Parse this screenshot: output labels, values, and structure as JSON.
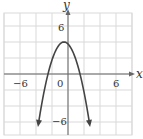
{
  "chart_data": {
    "type": "line",
    "title": "",
    "xlabel": "x",
    "ylabel": "y",
    "xlim": [
      -8,
      8
    ],
    "ylim": [
      -7.5,
      7.5
    ],
    "grid": true,
    "grid_step": 2,
    "x_tick_labels": [
      {
        "value": -6,
        "label": "−6"
      },
      {
        "value": 0,
        "label": "0"
      },
      {
        "value": 6,
        "label": "6"
      }
    ],
    "y_tick_labels": [
      {
        "value": 6,
        "label": "6"
      },
      {
        "value": -6,
        "label": "−6"
      }
    ],
    "series": [
      {
        "name": "parabola",
        "description": "downward-opening parabola, vertex near (-0.5, 4), x-intercepts near -2.5 and 1.5, arrows at both ends",
        "x": [
          -3.8,
          -3.5,
          -3,
          -2.5,
          -2,
          -1.5,
          -1,
          -0.5,
          0,
          0.5,
          1,
          1.5,
          2,
          2.5,
          2.8
        ],
        "y": [
          -8.9,
          -5.0,
          -2.25,
          0,
          1.75,
          3.0,
          3.75,
          4.0,
          3.75,
          3.0,
          1.75,
          0,
          -2.25,
          -5.0,
          -7.0
        ]
      }
    ],
    "legend": null
  },
  "labels": {
    "x_axis": "x",
    "y_axis": "y",
    "tick_x_neg6": "−6",
    "tick_x_0": "0",
    "tick_x_6": "6",
    "tick_y_6": "6",
    "tick_y_neg6": "−6"
  },
  "colors": {
    "grid": "#d9d9d9",
    "axis": "#555555",
    "curve": "#444444"
  }
}
